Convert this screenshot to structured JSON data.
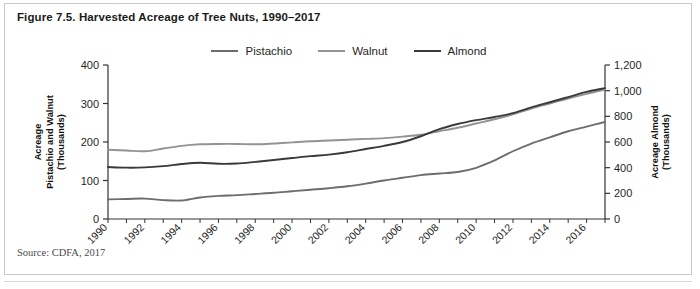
{
  "figure": {
    "title": "Figure 7.5. Harvested Acreage of Tree Nuts, 1990–2017",
    "source": "Source: CDFA, 2017"
  },
  "legend": {
    "position": "top-center",
    "entries": [
      {
        "label": "Pistachio",
        "color": "#6d6d6d",
        "width": 2.6
      },
      {
        "label": "Walnut",
        "color": "#939393",
        "width": 2.6
      },
      {
        "label": "Almond",
        "color": "#3a3a3a",
        "width": 2.6
      }
    ]
  },
  "chart_data": {
    "type": "line",
    "title": "Figure 7.5. Harvested Acreage of Tree Nuts, 1990–2017",
    "xlabel": "",
    "ylabel": "Acreage Pistachio and Walnut (Thousands)",
    "y2label": "Acreage Almond (Thousands)",
    "grid": false,
    "legend_position": "top-center",
    "x": [
      1990,
      1991,
      1992,
      1993,
      1994,
      1995,
      1996,
      1997,
      1998,
      1999,
      2000,
      2001,
      2002,
      2003,
      2004,
      2005,
      2006,
      2007,
      2008,
      2009,
      2010,
      2011,
      2012,
      2013,
      2014,
      2015,
      2016,
      2017
    ],
    "xlim": [
      1990,
      2017
    ],
    "xticks": [
      1990,
      1992,
      1994,
      1996,
      1998,
      2000,
      2002,
      2004,
      2006,
      2008,
      2010,
      2012,
      2014,
      2016
    ],
    "xtick_labels": [
      "1990",
      "1992",
      "1994",
      "1996",
      "1998",
      "2000",
      "2002",
      "2004",
      "2006",
      "2008",
      "2010",
      "2012",
      "2014",
      "2016"
    ],
    "ylim": [
      0,
      400
    ],
    "yticks": [
      0,
      100,
      200,
      300,
      400
    ],
    "ytick_labels": [
      "0",
      "100",
      "200",
      "300",
      "400"
    ],
    "y2lim": [
      0,
      1200
    ],
    "y2ticks": [
      0,
      200,
      400,
      600,
      800,
      1000,
      1200
    ],
    "y2tick_labels": [
      "0",
      "200",
      "400",
      "600",
      "800",
      "1,000",
      "1,200"
    ],
    "series": [
      {
        "name": "Pistachio",
        "axis": "left",
        "units": "thousand acres",
        "color": "#6d6d6d",
        "values": [
          51,
          52,
          53,
          49,
          48,
          56,
          60,
          62,
          65,
          68,
          72,
          76,
          80,
          85,
          92,
          100,
          107,
          114,
          118,
          122,
          133,
          152,
          176,
          196,
          212,
          228,
          240,
          252
        ]
      },
      {
        "name": "Walnut",
        "axis": "left",
        "units": "thousand acres",
        "color": "#939393",
        "values": [
          180,
          178,
          176,
          183,
          190,
          194,
          195,
          195,
          194,
          196,
          199,
          202,
          204,
          206,
          208,
          210,
          214,
          219,
          228,
          237,
          248,
          259,
          272,
          287,
          300,
          313,
          325,
          336
        ]
      },
      {
        "name": "Almond",
        "axis": "right",
        "units": "thousand acres",
        "color": "#3a3a3a",
        "values": [
          405,
          400,
          402,
          412,
          428,
          438,
          430,
          432,
          445,
          460,
          475,
          490,
          502,
          520,
          545,
          570,
          600,
          645,
          700,
          740,
          770,
          795,
          825,
          870,
          910,
          950,
          990,
          1020
        ]
      }
    ]
  },
  "axes": {
    "left_title_lines": [
      "Acreage",
      "Pistachio and Walnut",
      "(Thousands)"
    ],
    "right_title_lines": [
      "Acreage Almond",
      "(Thousands)"
    ]
  }
}
